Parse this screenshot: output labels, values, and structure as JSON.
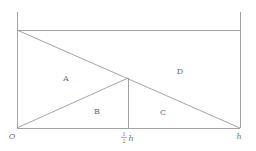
{
  "figure": {
    "canvas": {
      "width": 256,
      "height": 151,
      "background": "#ffffff"
    },
    "stroke": {
      "color": "#999999",
      "width": 0.9
    },
    "text_color": "#6b6b6b",
    "regions": [
      {
        "id": "A",
        "label": "A",
        "x": 66,
        "y": 79
      },
      {
        "id": "B",
        "label": "B",
        "x": 97,
        "y": 112
      },
      {
        "id": "C",
        "label": "C",
        "x": 163,
        "y": 113
      },
      {
        "id": "D",
        "label": "D",
        "x": 180,
        "y": 72
      }
    ],
    "axis_labels": {
      "origin": {
        "text": "O",
        "x": 12,
        "y": 139
      },
      "midpoint": {
        "numerator": "1",
        "denominator": "2",
        "variable": "h",
        "x": 128,
        "y": 141
      },
      "endpoint": {
        "text": "h",
        "x": 239,
        "y": 139
      }
    },
    "geometry": {
      "left_vertical": {
        "x1": 17,
        "y1": 12,
        "x2": 17,
        "y2": 128
      },
      "right_vertical": {
        "x1": 240,
        "y1": 12,
        "x2": 240,
        "y2": 128
      },
      "top_horizontal": {
        "x1": 17,
        "y1": 30,
        "x2": 240,
        "y2": 30
      },
      "bottom_horizontal": {
        "x1": 17,
        "y1": 128,
        "x2": 240,
        "y2": 128
      },
      "middle_vertical": {
        "x1": 128,
        "y1": 78,
        "x2": 128,
        "y2": 128
      },
      "diagonal_main": {
        "x1": 17,
        "y1": 30,
        "x2": 240,
        "y2": 128
      },
      "diagonal_lower": {
        "x1": 17,
        "y1": 128,
        "x2": 128,
        "y2": 78
      }
    }
  }
}
